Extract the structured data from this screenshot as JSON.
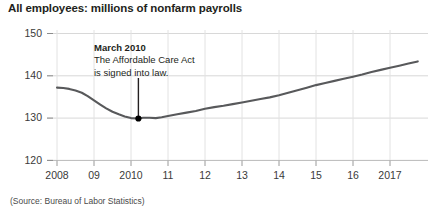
{
  "chart_data": {
    "type": "line",
    "title": "All employees: millions of nonfarm payrolls",
    "xlabel": "",
    "ylabel": "",
    "ylim": [
      120,
      150
    ],
    "xlim": [
      2008.0,
      2017.75
    ],
    "grid": true,
    "legend": "none",
    "y_ticks": [
      "120",
      "130",
      "140",
      "150"
    ],
    "y_tick_values": [
      120,
      130,
      140,
      150
    ],
    "x_ticks": [
      "2008",
      "09",
      "2010",
      "11",
      "12",
      "13",
      "14",
      "15",
      "16",
      "2017"
    ],
    "x_tick_values": [
      2008,
      2009,
      2010,
      2011,
      2012,
      2013,
      2014,
      2015,
      2016,
      2017
    ],
    "series": [
      {
        "name": "All employees: total nonfarm payrolls",
        "x": [
          2008.0,
          2008.17,
          2008.33,
          2008.5,
          2008.67,
          2008.83,
          2009.0,
          2009.17,
          2009.33,
          2009.5,
          2009.67,
          2009.83,
          2010.0,
          2010.17,
          2010.33,
          2010.5,
          2010.67,
          2010.83,
          2011.0,
          2011.25,
          2011.5,
          2011.75,
          2012.0,
          2012.25,
          2012.5,
          2012.75,
          2013.0,
          2013.25,
          2013.5,
          2013.75,
          2014.0,
          2014.25,
          2014.5,
          2014.75,
          2015.0,
          2015.25,
          2015.5,
          2015.75,
          2016.0,
          2016.25,
          2016.5,
          2016.75,
          2017.0,
          2017.25,
          2017.5,
          2017.75
        ],
        "y": [
          137.2,
          137.1,
          136.9,
          136.5,
          136.0,
          135.2,
          134.2,
          133.2,
          132.3,
          131.5,
          130.9,
          130.4,
          130.0,
          129.9,
          130.1,
          130.1,
          130.0,
          130.2,
          130.5,
          130.9,
          131.3,
          131.7,
          132.2,
          132.6,
          132.9,
          133.3,
          133.7,
          134.1,
          134.5,
          134.9,
          135.4,
          136.0,
          136.6,
          137.2,
          137.8,
          138.3,
          138.8,
          139.3,
          139.8,
          140.3,
          140.9,
          141.4,
          141.9,
          142.4,
          142.9,
          143.4
        ]
      }
    ],
    "annotations": [
      {
        "headline": "March 2010",
        "lines": [
          "The Affordable Care Act",
          "is signed into law."
        ],
        "point_x": 2010.2,
        "point_y": 129.9,
        "marker": "dot"
      }
    ],
    "source": "(Source: Bureau of Labor Statistics)",
    "colors": {
      "line": "#58595b",
      "grid": "#d9d9d9",
      "axis": "#bfbfbf",
      "text": "#231f20",
      "marker": "#000000"
    }
  }
}
